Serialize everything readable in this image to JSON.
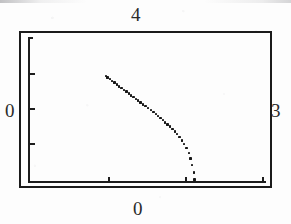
{
  "figure": {
    "kind": "scanned-plot",
    "background_color": "#fdfdfd",
    "ink_color": "#1b1b1b"
  },
  "labels": {
    "top": "4",
    "right": "3",
    "left": "0",
    "bottom": "0"
  },
  "chart_data": {
    "type": "scatter",
    "title": "",
    "subtitle": "",
    "xlabel": "0",
    "ylabel": "0",
    "top_label": "4",
    "right_label": "3",
    "grid": false,
    "legend": null,
    "axis_style": "inset L-shaped axis inside outer box frame",
    "xlim": [
      0,
      3
    ],
    "ylim": [
      0,
      4
    ],
    "x_ticks": [
      0.0,
      1.0,
      2.0,
      3.0
    ],
    "x_tick_labels": [
      "0",
      "",
      "",
      ""
    ],
    "y_ticks": [
      0.0,
      1.0,
      2.0,
      3.0,
      4.0
    ],
    "y_tick_labels": [
      "0",
      "",
      "",
      "",
      ""
    ],
    "series": [
      {
        "name": "data",
        "marker": "small dot",
        "color": "#171717",
        "x": [
          0.98,
          1.0,
          1.03,
          1.06,
          1.09,
          1.12,
          1.15,
          1.18,
          1.21,
          1.24,
          1.27,
          1.3,
          1.33,
          1.36,
          1.39,
          1.42,
          1.45,
          1.48,
          1.51,
          1.55,
          1.58,
          1.61,
          1.64,
          1.67,
          1.7,
          1.73,
          1.76,
          1.79,
          1.82,
          1.85,
          1.88,
          1.91,
          1.94,
          1.97,
          2.0,
          2.03,
          2.05,
          2.07,
          2.09,
          2.1
        ],
        "y": [
          2.92,
          2.88,
          2.83,
          2.78,
          2.73,
          2.68,
          2.63,
          2.58,
          2.53,
          2.48,
          2.43,
          2.38,
          2.33,
          2.28,
          2.23,
          2.18,
          2.13,
          2.08,
          2.03,
          1.97,
          1.92,
          1.86,
          1.81,
          1.75,
          1.69,
          1.63,
          1.57,
          1.51,
          1.44,
          1.37,
          1.3,
          1.22,
          1.13,
          1.03,
          0.92,
          0.78,
          0.62,
          0.44,
          0.24,
          0.04
        ]
      }
    ]
  },
  "pixel_geometry": {
    "frame": {
      "left": 19,
      "top": 31,
      "width": 253,
      "height": 157
    },
    "axis_origin": {
      "x": 28,
      "y": 181
    },
    "axis_x_end": 266,
    "axis_y_top": 37,
    "y_tick_pixels": [
      73,
      108,
      143
    ],
    "x_tick_pixels": [
      108,
      185,
      262
    ],
    "series_pixel_start": {
      "x": 105,
      "y": 76
    },
    "series_pixel_end": {
      "x": 185,
      "y": 181
    }
  }
}
